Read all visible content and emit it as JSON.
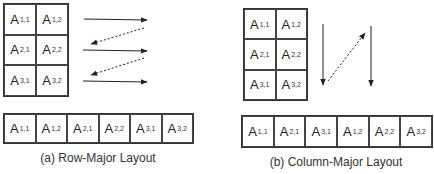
{
  "row_major": {
    "matrix": [
      [
        {
          "base": "A",
          "sub": "1,1"
        },
        {
          "base": "A",
          "sub": "1,2"
        }
      ],
      [
        {
          "base": "A",
          "sub": "2,1"
        },
        {
          "base": "A",
          "sub": "2,2"
        }
      ],
      [
        {
          "base": "A",
          "sub": "3,1"
        },
        {
          "base": "A",
          "sub": "3,2"
        }
      ]
    ],
    "memory": [
      {
        "base": "A",
        "sub": "1,1"
      },
      {
        "base": "A",
        "sub": "1,2"
      },
      {
        "base": "A",
        "sub": "2,1"
      },
      {
        "base": "A",
        "sub": "2,2"
      },
      {
        "base": "A",
        "sub": "3,1"
      },
      {
        "base": "A",
        "sub": "3,2"
      }
    ],
    "caption": "(a) Row-Major Layout"
  },
  "column_major": {
    "matrix": [
      [
        {
          "base": "A",
          "sub": "1,1"
        },
        {
          "base": "A",
          "sub": "1,2"
        }
      ],
      [
        {
          "base": "A",
          "sub": "2,1"
        },
        {
          "base": "A",
          "sub": "2,2"
        }
      ],
      [
        {
          "base": "A",
          "sub": "3,1"
        },
        {
          "base": "A",
          "sub": "3,2"
        }
      ]
    ],
    "memory": [
      {
        "base": "A",
        "sub": "1,1"
      },
      {
        "base": "A",
        "sub": "2,1"
      },
      {
        "base": "A",
        "sub": "3,1"
      },
      {
        "base": "A",
        "sub": "1,2"
      },
      {
        "base": "A",
        "sub": "2,2"
      },
      {
        "base": "A",
        "sub": "3,2"
      }
    ],
    "caption": "(b) Column-Major Layout"
  },
  "colors": {
    "stroke": "#222222",
    "background": "#ffffff"
  }
}
